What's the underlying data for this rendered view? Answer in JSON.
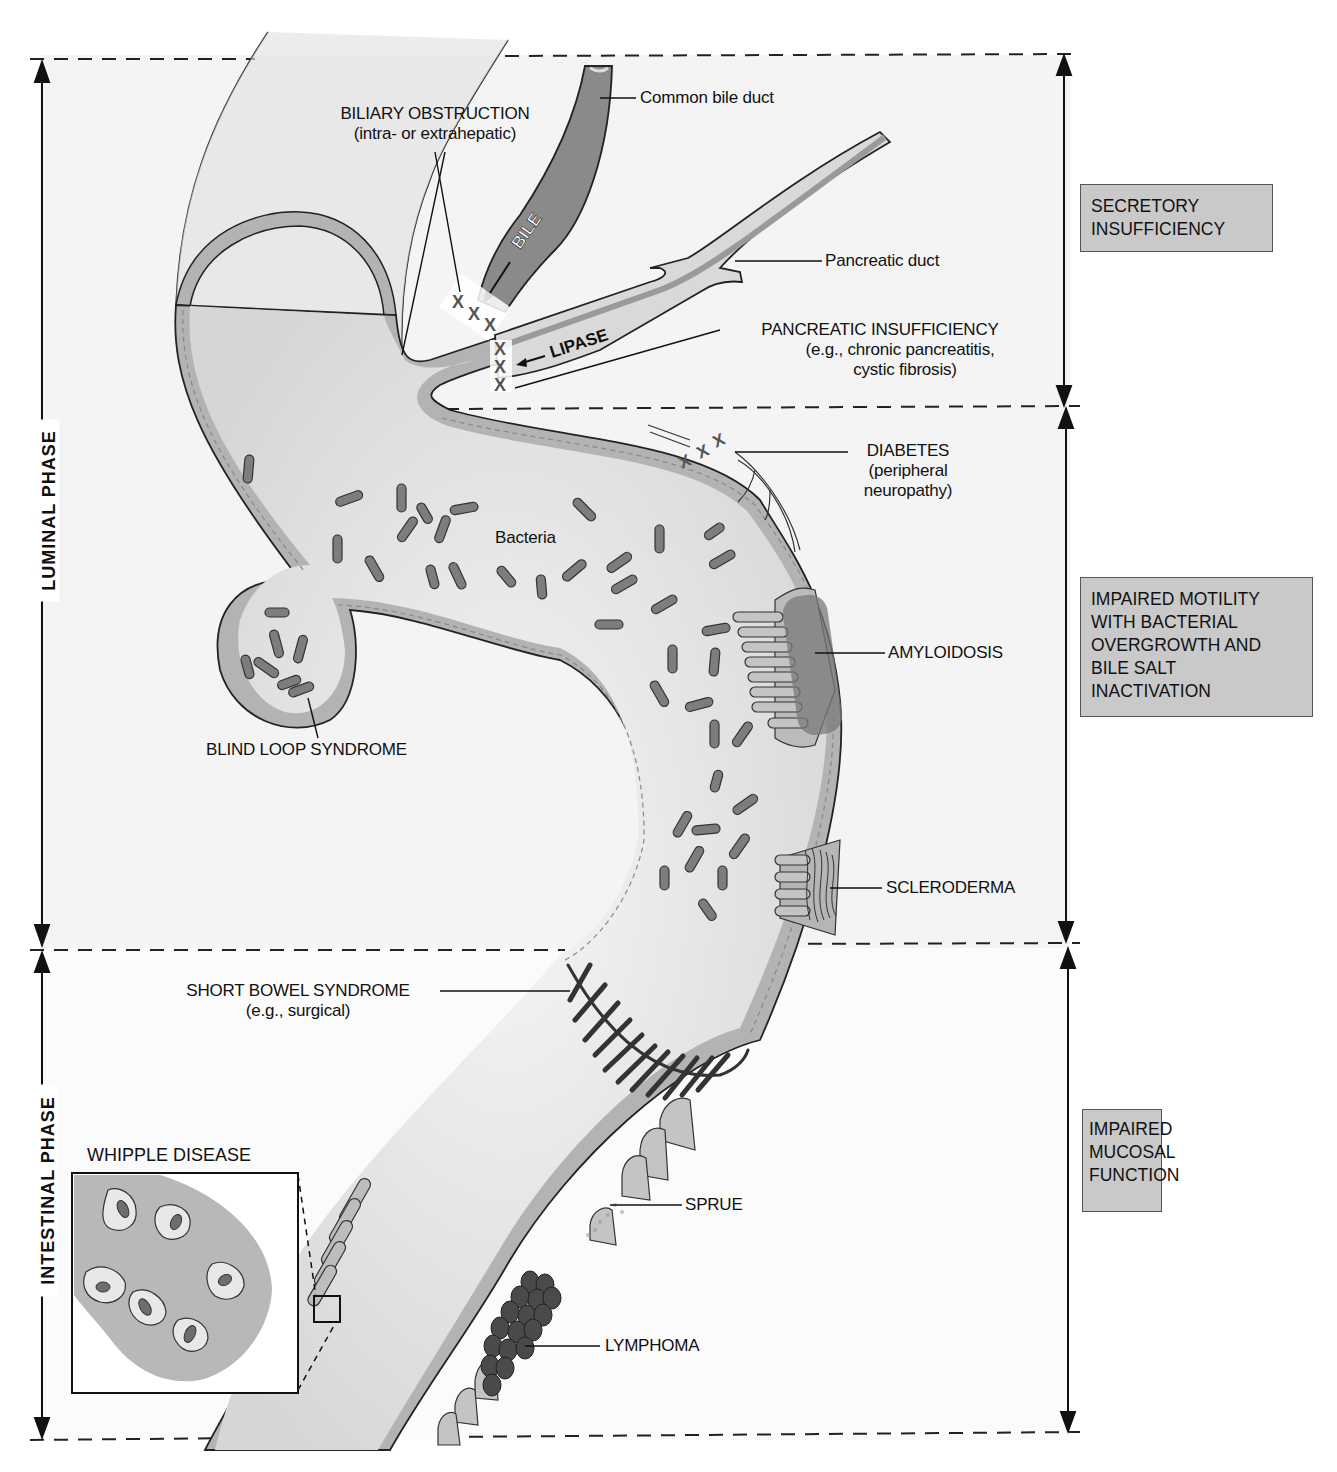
{
  "phases": {
    "luminal": "LUMINAL PHASE",
    "intestinal": "INTESTINAL PHASE"
  },
  "categories": [
    {
      "id": "secretory",
      "lines": [
        "SECRETORY",
        "INSUFFICIENCY"
      ]
    },
    {
      "id": "motility",
      "lines": [
        "IMPAIRED MOTILITY",
        "WITH BACTERIAL",
        "OVERGROWTH AND",
        "BILE SALT",
        "INACTIVATION"
      ]
    },
    {
      "id": "mucosal",
      "lines": [
        "IMPAIRED",
        "MUCOSAL",
        "FUNCTION"
      ]
    }
  ],
  "labels": {
    "common_bile_duct": "Common bile duct",
    "biliary_obstruction": "BILIARY OBSTRUCTION",
    "biliary_obstruction_sub": "(intra- or extrahepatic)",
    "bile": "BILE",
    "lipase": "LIPASE",
    "pancreatic_duct": "Pancreatic duct",
    "pancreatic_insufficiency": "PANCREATIC INSUFFICIENCY",
    "pancreatic_insufficiency_sub1": "(e.g., chronic pancreatitis,",
    "pancreatic_insufficiency_sub2": "cystic fibrosis)",
    "diabetes": "DIABETES",
    "diabetes_sub1": "(peripheral",
    "diabetes_sub2": "neuropathy)",
    "bacteria": "Bacteria",
    "amyloidosis": "AMYLOIDOSIS",
    "blind_loop": "BLIND LOOP SYNDROME",
    "scleroderma": "SCLERODERMA",
    "short_bowel": "SHORT BOWEL SYNDROME",
    "short_bowel_sub": "(e.g., surgical)",
    "whipple": "WHIPPLE DISEASE",
    "sprue": "SPRUE",
    "lymphoma": "LYMPHOMA",
    "obstruction_mark": "X"
  },
  "colors": {
    "wall": "#b3b3b3",
    "lumen": "#ececec",
    "bacteria": "#7d7d7d",
    "box_fill": "#c9c9c9",
    "bile_fill": "#8a8a8a",
    "lymphoma": "#4a4a4a"
  }
}
